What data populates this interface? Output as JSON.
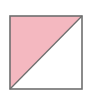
{
  "diagram": {
    "shape": "square",
    "division": "diagonal from bottom-left to top-right",
    "regions": [
      {
        "name": "upper-left-triangle",
        "fill": "#f4b8c0",
        "shaded": true
      },
      {
        "name": "lower-right-triangle",
        "fill": "#ffffff",
        "shaded": false
      }
    ],
    "border_color": "#6e6e6e",
    "shaded_fraction": "1/2"
  }
}
